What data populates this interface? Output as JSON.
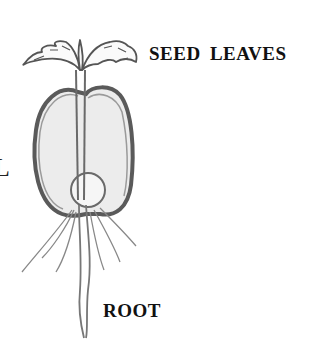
{
  "diagram": {
    "labels": {
      "seed_leaves": "SEED LEAVES",
      "root": "ROOT",
      "left_edge_fragment": "L"
    },
    "parts": [
      "seed-leaves",
      "stem",
      "seed-coat",
      "embryo",
      "root",
      "root-hairs"
    ],
    "colors": {
      "line": "#555555",
      "seed_fill": "#ececec",
      "text": "#111111",
      "background": "#ffffff"
    }
  }
}
